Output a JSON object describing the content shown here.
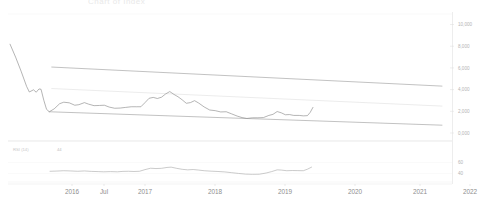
{
  "chart_title": "Chart of Index",
  "chart_data": {
    "type": "line",
    "title": "Chart of Index",
    "xlabel": "",
    "ylabel": "",
    "grid": false,
    "legend_position": "none",
    "x_tick_labels": [
      "2016",
      "Jul",
      "2017",
      "2018",
      "2019",
      "2020",
      "2021",
      "2022"
    ],
    "x_tick_positions": [
      72,
      104,
      145,
      215,
      285,
      355,
      420,
      470
    ],
    "y_tick_labels": [
      "10,000",
      "8,000",
      "6,000",
      "4,000",
      "2,000",
      "0,000"
    ],
    "y_tick_values": [
      10000,
      8000,
      6000,
      4000,
      2000,
      0
    ],
    "ylim": [
      0,
      10600
    ],
    "xlim_years": [
      2015.55,
      2022.0
    ],
    "series": [
      {
        "name": "Price",
        "color": "#8c8c8c",
        "points": [
          [
            2015.58,
            8180
          ],
          [
            2015.66,
            7000
          ],
          [
            2015.74,
            5700
          ],
          [
            2015.82,
            4300
          ],
          [
            2015.86,
            3780
          ],
          [
            2015.92,
            3980
          ],
          [
            2015.96,
            3760
          ],
          [
            2016.0,
            4060
          ],
          [
            2016.03,
            4030
          ],
          [
            2016.07,
            3020
          ],
          [
            2016.11,
            2180
          ],
          [
            2016.15,
            1960
          ],
          [
            2016.22,
            2220
          ],
          [
            2016.3,
            2700
          ],
          [
            2016.36,
            2840
          ],
          [
            2016.44,
            2780
          ],
          [
            2016.52,
            2560
          ],
          [
            2016.58,
            2610
          ],
          [
            2016.66,
            2800
          ],
          [
            2016.72,
            2660
          ],
          [
            2016.8,
            2520
          ],
          [
            2016.88,
            2540
          ],
          [
            2016.95,
            2560
          ],
          [
            2017.02,
            2390
          ],
          [
            2017.1,
            2280
          ],
          [
            2017.18,
            2300
          ],
          [
            2017.26,
            2360
          ],
          [
            2017.34,
            2420
          ],
          [
            2017.42,
            2420
          ],
          [
            2017.48,
            2420
          ],
          [
            2017.54,
            2800
          ],
          [
            2017.6,
            3200
          ],
          [
            2017.66,
            3280
          ],
          [
            2017.72,
            3180
          ],
          [
            2017.78,
            3300
          ],
          [
            2017.84,
            3600
          ],
          [
            2017.9,
            3820
          ],
          [
            2017.96,
            3560
          ],
          [
            2018.02,
            3340
          ],
          [
            2018.08,
            3060
          ],
          [
            2018.14,
            2740
          ],
          [
            2018.2,
            2800
          ],
          [
            2018.26,
            2980
          ],
          [
            2018.32,
            2760
          ],
          [
            2018.4,
            2400
          ],
          [
            2018.48,
            2120
          ],
          [
            2018.56,
            2060
          ],
          [
            2018.64,
            1940
          ],
          [
            2018.72,
            1960
          ],
          [
            2018.8,
            1760
          ],
          [
            2018.88,
            1560
          ],
          [
            2018.95,
            1420
          ],
          [
            2019.02,
            1340
          ],
          [
            2019.1,
            1400
          ],
          [
            2019.18,
            1400
          ],
          [
            2019.26,
            1420
          ],
          [
            2019.34,
            1620
          ],
          [
            2019.4,
            1720
          ],
          [
            2019.46,
            1980
          ],
          [
            2019.52,
            1860
          ],
          [
            2019.58,
            1680
          ],
          [
            2019.64,
            1700
          ],
          [
            2019.7,
            1620
          ],
          [
            2019.78,
            1620
          ],
          [
            2019.84,
            1580
          ],
          [
            2019.9,
            1600
          ],
          [
            2019.94,
            1900
          ],
          [
            2019.98,
            2360
          ]
        ]
      }
    ],
    "trendlines": [
      {
        "name": "upper-resistance",
        "color": "#8f8f8f",
        "x0": 2016.18,
        "y0": 6080,
        "x1": 2021.86,
        "y1": 4320
      },
      {
        "name": "mid-dashed",
        "color": "#dcdcdc",
        "x0": 2016.18,
        "y0": 4100,
        "x1": 2021.86,
        "y1": 2480
      },
      {
        "name": "lower-support",
        "color": "#8f8f8f",
        "x0": 2016.14,
        "y0": 1960,
        "x1": 2021.86,
        "y1": 720
      }
    ],
    "subchart": {
      "type": "line",
      "indicator_label": "RSI (14)",
      "indicator_value": "44",
      "y_tick_labels": [
        "60",
        "40"
      ],
      "y_tick_values": [
        60,
        40
      ],
      "ylim": [
        28,
        72
      ],
      "series": [
        {
          "name": "RSI",
          "color": "#a8a8a8",
          "points": [
            [
              2016.16,
              44.0
            ],
            [
              2016.26,
              44.4
            ],
            [
              2016.36,
              45.0
            ],
            [
              2016.46,
              44.6
            ],
            [
              2016.56,
              44.0
            ],
            [
              2016.66,
              44.6
            ],
            [
              2016.76,
              43.8
            ],
            [
              2016.86,
              43.4
            ],
            [
              2016.94,
              43.0
            ],
            [
              2017.04,
              43.4
            ],
            [
              2017.14,
              43.0
            ],
            [
              2017.22,
              43.8
            ],
            [
              2017.3,
              44.0
            ],
            [
              2017.38,
              43.6
            ],
            [
              2017.46,
              44.0
            ],
            [
              2017.54,
              47.0
            ],
            [
              2017.62,
              49.6
            ],
            [
              2017.7,
              49.0
            ],
            [
              2017.78,
              49.4
            ],
            [
              2017.86,
              51.0
            ],
            [
              2017.92,
              51.6
            ],
            [
              2018.0,
              49.4
            ],
            [
              2018.08,
              47.6
            ],
            [
              2018.16,
              46.6
            ],
            [
              2018.24,
              47.2
            ],
            [
              2018.32,
              46.2
            ],
            [
              2018.4,
              45.0
            ],
            [
              2018.5,
              44.2
            ],
            [
              2018.6,
              43.6
            ],
            [
              2018.7,
              42.8
            ],
            [
              2018.8,
              41.4
            ],
            [
              2018.9,
              40.0
            ],
            [
              2019.0,
              38.8
            ],
            [
              2019.1,
              38.4
            ],
            [
              2019.2,
              38.6
            ],
            [
              2019.3,
              40.8
            ],
            [
              2019.38,
              43.4
            ],
            [
              2019.46,
              46.6
            ],
            [
              2019.52,
              46.2
            ],
            [
              2019.6,
              45.0
            ],
            [
              2019.68,
              45.4
            ],
            [
              2019.76,
              45.2
            ],
            [
              2019.84,
              45.0
            ],
            [
              2019.9,
              47.8
            ],
            [
              2019.96,
              51.6
            ]
          ]
        }
      ]
    }
  }
}
